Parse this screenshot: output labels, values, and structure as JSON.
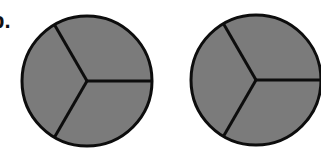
{
  "label": "b.",
  "style": {
    "fill": "#7b7b7b",
    "stroke": "#0d0d0d",
    "background": "#ffffff"
  },
  "circles": [
    {
      "name": "circle-1",
      "cx": 87,
      "cy": 81,
      "r": 65,
      "sectors": 3,
      "shaded_sectors": 3
    },
    {
      "name": "circle-2",
      "cx": 256,
      "cy": 80,
      "r": 65,
      "sectors": 3,
      "shaded_sectors": 3
    }
  ]
}
